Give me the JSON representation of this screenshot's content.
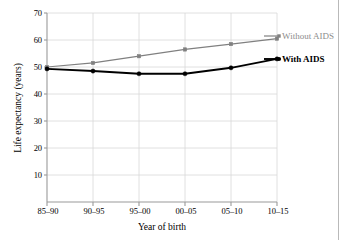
{
  "chart_data": {
    "type": "line",
    "title": "",
    "xlabel": "Year of birth",
    "ylabel": "Life expectancy (years)",
    "categories": [
      "85–90",
      "90–95",
      "95–00",
      "00–05",
      "05–10",
      "10–15"
    ],
    "yticks": [
      10,
      20,
      30,
      40,
      50,
      60,
      70
    ],
    "ylim": [
      0,
      70
    ],
    "grid": "both",
    "legend_position": "inline-right-of-line-ends",
    "series": [
      {
        "name": "Without AIDS",
        "color": "#808080",
        "marker": "square",
        "values": [
          50.0,
          51.5,
          54.0,
          56.5,
          58.5,
          60.5
        ]
      },
      {
        "name": "With AIDS",
        "color": "#000000",
        "marker": "circle",
        "values": [
          49.3,
          48.5,
          47.5,
          47.5,
          49.7,
          53.0
        ]
      }
    ]
  },
  "axis": {
    "ytick_labels": [
      "70",
      "60",
      "50",
      "40",
      "30",
      "20",
      "10"
    ],
    "xtick_labels": [
      "85–90",
      "90–95",
      "95–00",
      "00–05",
      "05–10",
      "10–15"
    ],
    "ylabel": "Life expectancy (years)",
    "xlabel": "Year of birth"
  },
  "labels": {
    "without_aids": "Without AIDS",
    "with_aids": "With AIDS"
  },
  "colors": {
    "without_aids": "#808080",
    "with_aids": "#000000",
    "grid": "#d8d8d8",
    "axis": "#9a9a9a",
    "background": "#ffffff"
  }
}
